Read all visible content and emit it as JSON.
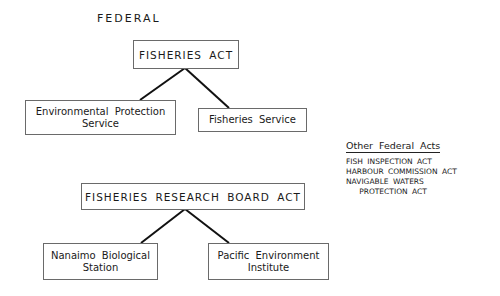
{
  "section_title": "FEDERAL",
  "tree1": {
    "root": "FISHERIES ACT",
    "children": [
      "Environmental Protection\nService",
      "Fisheries Service"
    ]
  },
  "tree2": {
    "root": "FISHERIES RESEARCH BOARD ACT",
    "children": [
      "Nanaimo Biological\nStation",
      "Pacific Environment\nInstitute"
    ]
  },
  "legend": {
    "heading": "Other Federal Acts",
    "items": [
      "FISH INSPECTION ACT",
      "HARBOUR COMMISSION ACT",
      "NAVIGABLE WATERS",
      "   PROTECTION ACT"
    ]
  },
  "colors": {
    "line": "#111111",
    "border": "#6a6a6a",
    "text": "#1a1a1a"
  }
}
